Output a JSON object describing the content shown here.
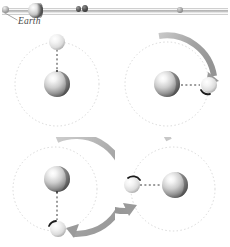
{
  "figure": {
    "background_color": "#ffffff",
    "width": 230,
    "height": 247
  },
  "scale_strip": {
    "name": "earth-moon-distance-scale",
    "label": "Earth",
    "rail_color": "#b9b9b9",
    "objects": [
      {
        "name": "left-marker",
        "kind": "small-sphere",
        "x": 5,
        "diameter": 7
      },
      {
        "name": "earth",
        "kind": "sphere",
        "x": 35,
        "diameter": 15
      },
      {
        "name": "mid-marker-a",
        "kind": "small-sphere",
        "x": 78,
        "diameter": 5
      },
      {
        "name": "mid-marker-b",
        "kind": "small-sphere",
        "x": 85,
        "diameter": 6
      },
      {
        "name": "moon",
        "kind": "small-sphere",
        "x": 180,
        "diameter": 6
      }
    ]
  },
  "panels": [
    {
      "name": "panel-start",
      "step": 1,
      "moon_angle_deg": 90,
      "rotation_deg": 0,
      "arrow": false,
      "arrow_sweep_deg": 0,
      "marker_visible": false,
      "orbit_style": "dotted",
      "radius_link": "dashed"
    },
    {
      "name": "panel-quarter",
      "step": 2,
      "moon_angle_deg": 0,
      "rotation_deg": 90,
      "arrow": true,
      "arrow_sweep_deg": 95,
      "marker_visible": true,
      "marker_angle_deg": 200,
      "orbit_style": "dotted",
      "radius_link": "dashed"
    },
    {
      "name": "panel-half",
      "step": 3,
      "moon_angle_deg": 270,
      "rotation_deg": 180,
      "arrow": true,
      "arrow_sweep_deg": 190,
      "marker_visible": true,
      "marker_angle_deg": 150,
      "orbit_style": "dotted",
      "radius_link": "dashed"
    },
    {
      "name": "panel-three-quarter",
      "step": 4,
      "moon_angle_deg": 180,
      "rotation_deg": 270,
      "arrow": true,
      "arrow_sweep_deg": 275,
      "marker_visible": true,
      "marker_angle_deg": 60,
      "orbit_style": "dotted",
      "radius_link": "dashed"
    }
  ],
  "style": {
    "orbit_color": "#d5d5d5",
    "arrow_color": "#9a9a9a",
    "arrow_color_light": "#c6c6c6",
    "marker_color": "#1c1c1c",
    "link_color": "#333333",
    "earth_highlight": "#ffffff",
    "earth_mid": "#c9c9c9",
    "earth_shadow": "#5e5e5e",
    "moon_highlight": "#ffffff",
    "moon_mid": "#e2e2e2",
    "moon_shadow": "#9d9d9d",
    "label_color": "#4a4a4a"
  }
}
